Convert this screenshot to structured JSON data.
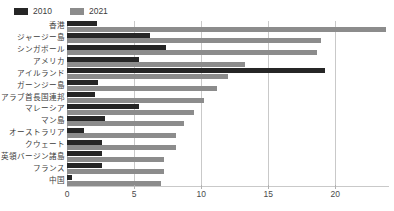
{
  "legend": {
    "position": "top-left",
    "items": [
      {
        "label": "2010",
        "color": "#262626",
        "name": "legend-2010"
      },
      {
        "label": "2021",
        "color": "#8c8c8c",
        "name": "legend-2021"
      }
    ]
  },
  "axis": {
    "ticks": [
      "0",
      "5",
      "10",
      "15",
      "20"
    ],
    "tick_values": [
      0,
      5,
      10,
      15,
      20
    ],
    "xlabel": "",
    "ylabel": ""
  },
  "chart_data": {
    "type": "bar",
    "orientation": "horizontal",
    "title": "",
    "subtitle": "",
    "xlabel": "",
    "ylabel": "",
    "xlim": [
      0,
      24
    ],
    "ylim": null,
    "grid": true,
    "legend_position": "top-left",
    "categories": [
      "香港",
      "ジャージー島",
      "シンガポール",
      "アメリカ",
      "アイルランド",
      "ガーンジー島",
      "アラブ首長国連邦",
      "マレーシア",
      "マン島",
      "オーストラリア",
      "クウェート",
      "英領バージン諸島",
      "フランス",
      "中国"
    ],
    "series": [
      {
        "name": "2010",
        "color": "#262626",
        "values": [
          2.2,
          6.2,
          7.4,
          5.4,
          19.2,
          2.3,
          2.1,
          5.4,
          2.8,
          1.3,
          2.6,
          2.6,
          2.6,
          0.4
        ]
      },
      {
        "name": "2021",
        "color": "#8c8c8c",
        "values": [
          23.8,
          18.9,
          18.6,
          13.3,
          12.0,
          11.2,
          10.2,
          9.5,
          8.7,
          8.1,
          8.1,
          7.2,
          7.2,
          7.0
        ]
      }
    ]
  }
}
